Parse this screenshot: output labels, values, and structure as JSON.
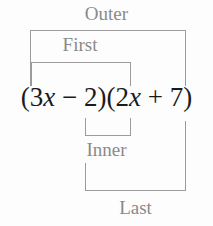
{
  "diagram": {
    "kind": "foil-method-diagram",
    "background_color": "#fdfdfd",
    "line_color": "#9b9b9b",
    "label_color": "#8a8a8a",
    "expression_color": "#1b1b1b",
    "expression": {
      "full_text": "(3x − 2)(2x + 7)",
      "first_factor": "(3x − 2)",
      "second_factor": "(2x + 7)",
      "tokens": {
        "open_paren_1": "(",
        "coefficient_1": "3",
        "variable_1": "x",
        "operator_1": "−",
        "constant_1": "2",
        "close_paren_1": ")",
        "open_paren_2": "(",
        "coefficient_2": "2",
        "variable_2": "x",
        "operator_2": "+",
        "constant_2": "7",
        "close_paren_2": ")"
      }
    },
    "labels": {
      "outer": "Outer",
      "first": "First",
      "inner": "Inner",
      "last": "Last"
    }
  }
}
